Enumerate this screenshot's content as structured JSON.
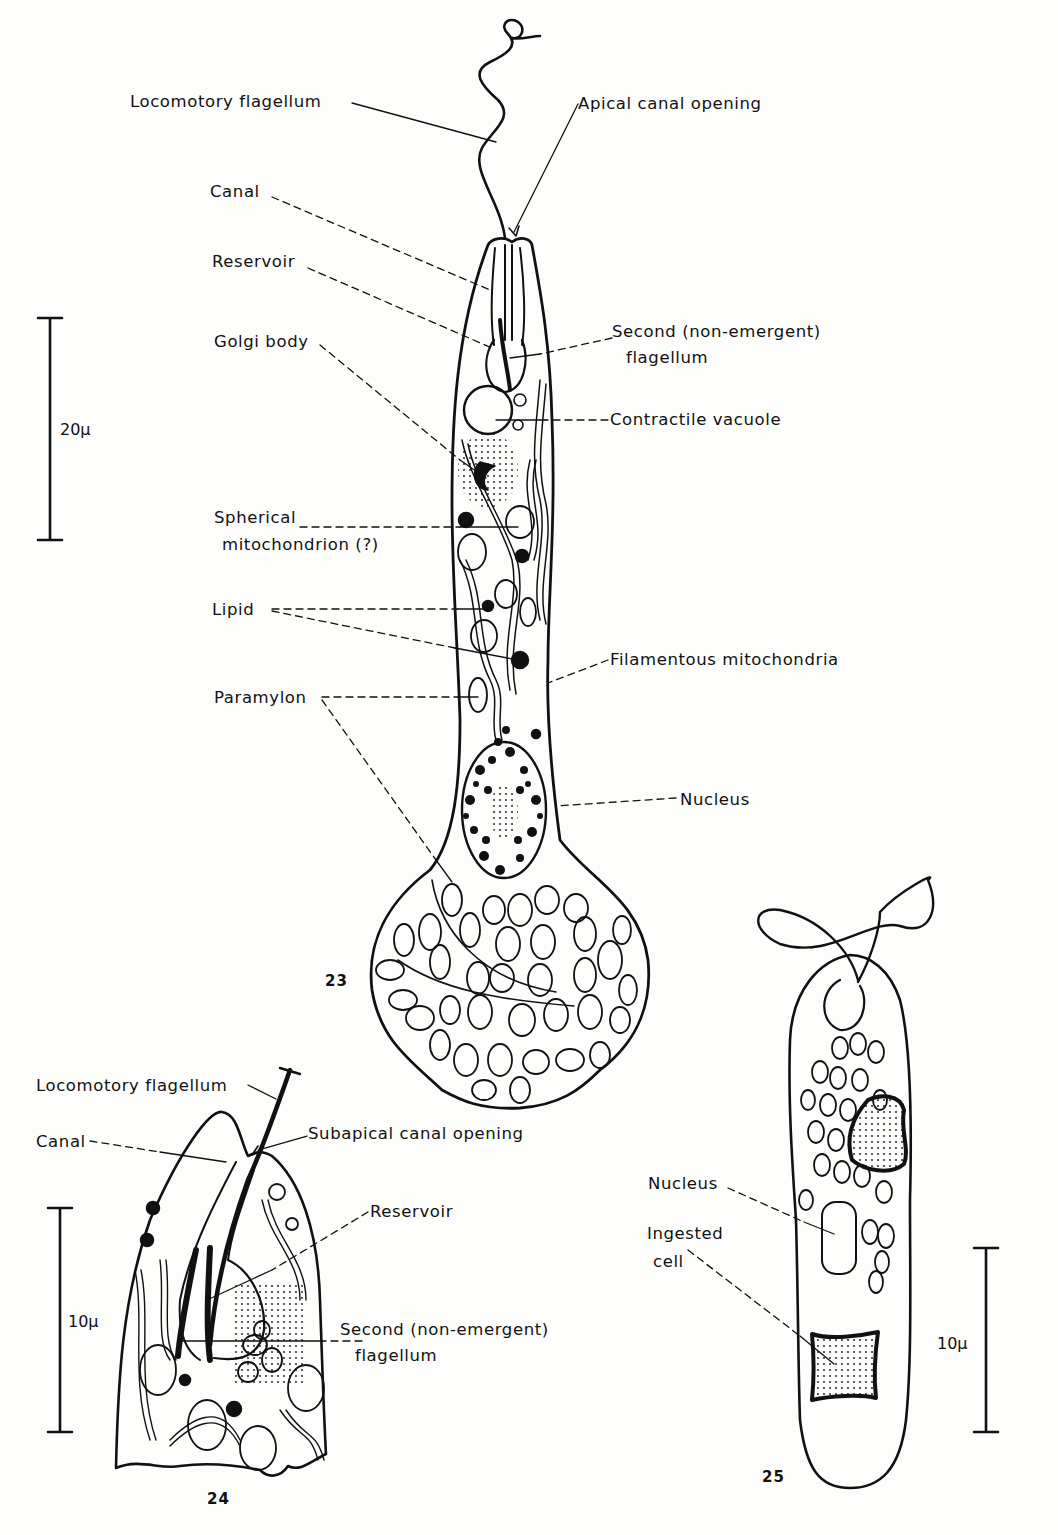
{
  "figure23": {
    "number": "23",
    "scale_bar": "20μ",
    "labels": {
      "locomotory_flagellum": "Locomotory flagellum",
      "apical_canal_opening": "Apical canal opening",
      "canal": "Canal",
      "reservoir": "Reservoir",
      "second_flagellum_1": "Second (non-emergent)",
      "second_flagellum_2": "flagellum",
      "golgi_body": "Golgi body",
      "contractile_vacuole": "Contractile vacuole",
      "spherical_mito_1": "Spherical",
      "spherical_mito_2": "mitochondrion (?)",
      "lipid": "Lipid",
      "filamentous_mito": "Filamentous mitochondria",
      "paramylon": "Paramylon",
      "nucleus": "Nucleus"
    }
  },
  "figure24": {
    "number": "24",
    "scale_bar": "10μ",
    "labels": {
      "locomotory_flagellum": "Locomotory flagellum",
      "canal": "Canal",
      "subapical_canal_opening": "Subapical canal opening",
      "reservoir": "Reservoir",
      "second_flagellum_1": "Second (non-emergent)",
      "second_flagellum_2": "flagellum"
    }
  },
  "figure25": {
    "number": "25",
    "scale_bar": "10μ",
    "labels": {
      "nucleus": "Nucleus",
      "ingested_cell_1": "Ingested",
      "ingested_cell_2": "cell"
    }
  }
}
